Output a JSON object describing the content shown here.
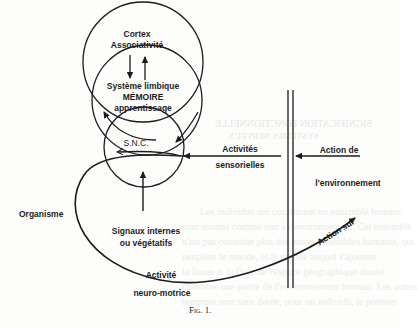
{
  "figure": {
    "caption": "Fig. 1.",
    "labels": {
      "cortex": "Cortex",
      "associativite": "Associativité",
      "systeme_limbique": "Système limbique",
      "memoire": "MÉMOIRE",
      "apprentissage": "apprentissage",
      "snc": "S.N.C.",
      "activites": "Activités",
      "sensorielles": "sensorielles",
      "action_de": "Action de",
      "environnement": "l'environnement",
      "organisme": "Organisme",
      "signaux_internes": "Signaux internes",
      "vegetatifs": "ou végétatifs",
      "activite": "Activité",
      "neuro_motrice": "neuro-motrice",
      "action_sur": "Action sur"
    }
  },
  "bleed_through": {
    "heading1": "SIGNIFICATION FONCTIONNELLE",
    "heading2": "SYSTÈMES NERVEUX",
    "lines": [
      "Les individus qui constituent un ensemble humain",
      "sont soumis comme eux à l'environnement. Cet ensemble",
      "n'est pas constitué plus des autres ensembles humains, qui",
      "peuplent le monde, et le monde auquel s'ajoutent",
      "la faune et la flore de l'espace géographique donné",
      "constitue une partie de l'environnement humain. Les autres",
      "hommes sont sans doute, pour un individu, le premier"
    ]
  }
}
